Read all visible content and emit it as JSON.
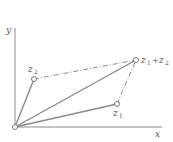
{
  "diagram": {
    "axes": {
      "x_label": "x",
      "y_label": "y"
    },
    "points": {
      "origin": {
        "x": 15,
        "y": 127
      },
      "z1": {
        "x": 117,
        "y": 104
      },
      "z2": {
        "x": 34,
        "y": 79
      },
      "sum": {
        "x": 136,
        "y": 60
      }
    },
    "labels": {
      "z1_base": "z",
      "z1_sub": "1",
      "z2_base": "z",
      "z2_sub": "2",
      "sum_a_base": "z",
      "sum_a_sub": "1",
      "sum_plus": "+",
      "sum_b_base": "z",
      "sum_b_sub": "2"
    },
    "colors": {
      "line": "#8a8a8a",
      "text": "#555555",
      "background": "#ffffff"
    }
  }
}
